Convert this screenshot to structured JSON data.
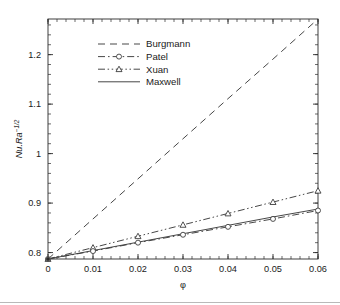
{
  "chart_data": {
    "type": "line",
    "title": "",
    "xlabel": "φ",
    "ylabel": "Nu.Ra",
    "ylabel_sup": "−1/2",
    "xlim": [
      0,
      0.06
    ],
    "ylim": [
      0.787,
      1.272
    ],
    "x": [
      0,
      0.01,
      0.02,
      0.03,
      0.04,
      0.05,
      0.06
    ],
    "xticks": [
      0,
      0.01,
      0.02,
      0.03,
      0.04,
      0.05,
      0.06
    ],
    "xtick_labels": [
      "0",
      "0.01",
      "0.02",
      "0.03",
      "0.04",
      "0.05",
      "0.06"
    ],
    "yticks": [
      0.8,
      0.9,
      1.0,
      1.1,
      1.2
    ],
    "ytick_labels": [
      "0.8",
      "0.9",
      "1",
      "1.1",
      "1.2"
    ],
    "x_minor_step": 0.002,
    "y_minor_step": 0.02,
    "grid": false,
    "legend_position": "upper-left-inside",
    "series": [
      {
        "name": "Burgmann",
        "style": "dashed",
        "marker": "none",
        "color": "#3d3d3d",
        "values": [
          0.787,
          0.868,
          0.949,
          1.03,
          1.111,
          1.191,
          1.272
        ]
      },
      {
        "name": "Patel",
        "style": "dash-dot",
        "marker": "circle",
        "color": "#3d3d3d",
        "values": [
          0.787,
          0.803,
          0.82,
          0.836,
          0.852,
          0.868,
          0.885
        ]
      },
      {
        "name": "Xuan",
        "style": "dash-dot-dot",
        "marker": "triangle",
        "color": "#3d3d3d",
        "values": [
          0.787,
          0.81,
          0.833,
          0.856,
          0.879,
          0.902,
          0.925
        ]
      },
      {
        "name": "Maxwell",
        "style": "solid",
        "marker": "none",
        "color": "#3d3d3d",
        "values": [
          0.787,
          0.804,
          0.821,
          0.838,
          0.855,
          0.872,
          0.888
        ]
      }
    ]
  },
  "legend": {
    "entries": [
      {
        "label": "Burgmann"
      },
      {
        "label": "Patel"
      },
      {
        "label": "Xuan"
      },
      {
        "label": "Maxwell"
      }
    ]
  },
  "axes": {
    "x_title": "φ",
    "y_title_main": "Nu.Ra",
    "y_title_exponent": "−1/2"
  }
}
